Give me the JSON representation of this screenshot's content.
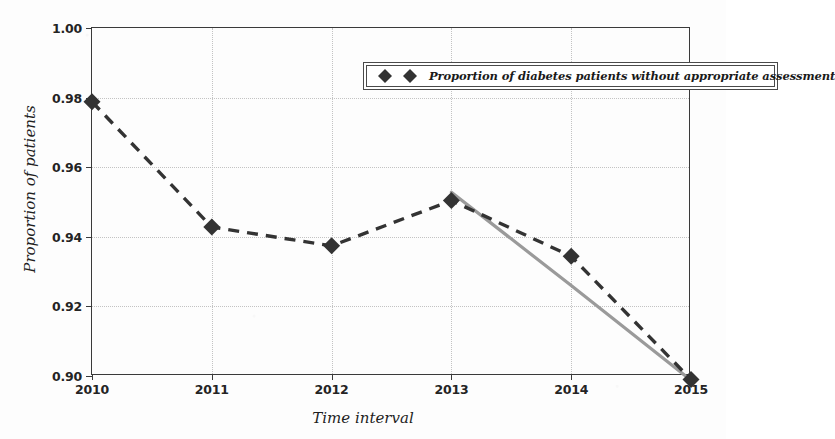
{
  "chart_data": {
    "type": "line",
    "title": "",
    "xlabel": "Time interval",
    "ylabel": "Proportion of patients",
    "x": [
      2010,
      2011,
      2012,
      2013,
      2014,
      2015
    ],
    "xticklabels": [
      "2010",
      "2011",
      "2012",
      "2013",
      "2014",
      "2015"
    ],
    "yticklabels": [
      "0.90",
      "0.92",
      "0.94",
      "0.96",
      "0.98",
      "1.00"
    ],
    "yticks": [
      0.9,
      0.92,
      0.94,
      0.96,
      0.98,
      1.0
    ],
    "xlim": [
      2010,
      2015
    ],
    "ylim": [
      0.9,
      1.0
    ],
    "grid": "dotted-both-axes",
    "legend_position": "upper-right-inside",
    "series": [
      {
        "name": "Proportion of diabetes patients without appropriate assessment",
        "style": "dashed-with-diamond-markers",
        "color": "#333333",
        "marker": "diamond",
        "values": [
          0.9788,
          0.9428,
          0.9374,
          0.9504,
          0.9344,
          0.899
        ]
      },
      {
        "name": "trend-line-2013-2015",
        "style": "solid",
        "color": "#9a9a9a",
        "marker": "none",
        "values": [
          null,
          null,
          null,
          0.9528,
          0.926,
          0.8988
        ]
      }
    ]
  },
  "legend": {
    "entries": [
      {
        "label": "Proportion of diabetes patients without appropriate assessment",
        "marker": "diamond-pair"
      }
    ]
  },
  "colors": {
    "series_dashed": "#333333",
    "trend_line": "#9a9a9a",
    "axis": "#3a3a3a",
    "grid": "#c3c3c3",
    "background": "#fdfdfd"
  }
}
